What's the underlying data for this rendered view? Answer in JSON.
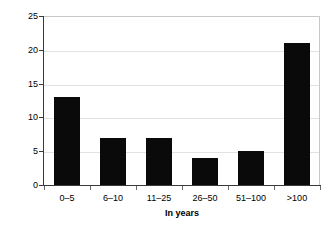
{
  "chart_data": {
    "type": "bar",
    "title": "",
    "xlabel": "In years",
    "ylabel": "Number of responses",
    "categories": [
      "0–5",
      "6–10",
      "11–25",
      "26–50",
      "51–100",
      ">100"
    ],
    "values": [
      13,
      7,
      7,
      4,
      5,
      21
    ],
    "series": [
      {
        "name": "Number of responses",
        "values": [
          13,
          7,
          7,
          4,
          5,
          21
        ]
      }
    ],
    "ylim": [
      0,
      25
    ],
    "yticks": [
      0,
      5,
      10,
      15,
      20,
      25
    ],
    "ytick_labels": [
      "0",
      "5",
      "10",
      "15",
      "20",
      "25"
    ],
    "grid": "horizontal",
    "legend": "none",
    "bar_color": "#0a0a0a",
    "gridline_color": "#e2e2e2",
    "axis_color": "#3a3a3a",
    "plot_border_color": "#c8c8c8",
    "background_color": "#ffffff"
  }
}
